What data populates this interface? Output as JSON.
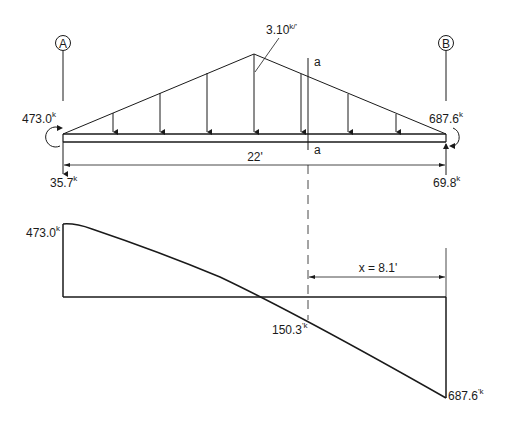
{
  "supports": {
    "left": {
      "label": "A",
      "moment": "473.0",
      "moment_unit": "'k",
      "reaction": "35.7",
      "reaction_unit": "k"
    },
    "right": {
      "label": "B",
      "moment": "687.6",
      "moment_unit": "'k",
      "reaction": "69.8",
      "reaction_unit": "k"
    }
  },
  "load": {
    "peak": "3.10",
    "peak_unit": "k/'",
    "shape": "triangular"
  },
  "span": {
    "length": "22'"
  },
  "section": {
    "top_label": "a",
    "bottom_label": "a"
  },
  "moment_diagram": {
    "left_value": "473.0",
    "left_unit": "'k",
    "section_value": "150.3",
    "section_unit": "'k",
    "right_value": "687.6",
    "right_unit": "'k",
    "distance_label": "x = 8.1'"
  },
  "colors": {
    "line": "#1a1a1a",
    "background": "#ffffff"
  }
}
